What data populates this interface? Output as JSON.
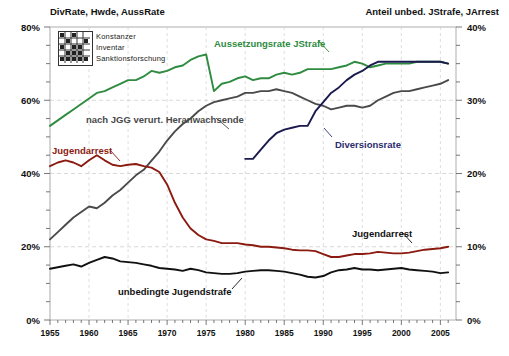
{
  "header": {
    "left": "DivRate, Hwde, AussRate",
    "right": "Anteil unbed. JStrafe, JArrest"
  },
  "logo": {
    "line1": "Konstanzer",
    "line2": "Inventar",
    "line3": "Sanktionsforschung",
    "icon": "kis-logo-icon"
  },
  "axes": {
    "left_ticks": [
      "80%",
      "60%",
      "40%",
      "20%",
      "0%"
    ],
    "right_ticks": [
      "40%",
      "30%",
      "20%",
      "10%",
      "0%"
    ],
    "x_ticks": [
      "1955",
      "1960",
      "1965",
      "1970",
      "1975",
      "1980",
      "1985",
      "1990",
      "1995",
      "2000",
      "2005"
    ]
  },
  "labels": {
    "aussetzungsrate": "Aussetzungsrate JStrafe",
    "heranwachsende": "nach JGG verurt. Heranwachsende",
    "jugendarrest_left": "Jugendarrest",
    "jugendarrest_right": "Jugendarrest",
    "diversionsrate": "Diversionsrate",
    "unbedingte": "unbedingte Jugendstrafe"
  },
  "colors": {
    "green": "#2e8b3f",
    "gray": "#4a4a4a",
    "darkred": "#8b1a10",
    "navy": "#1a1a4e",
    "black": "#111111",
    "grid": "#cfcfcf",
    "axis": "#9a9a9a"
  },
  "chart_data": {
    "type": "line",
    "title": "",
    "xlabel": "",
    "ylabel": "DivRate, Hwde, AussRate",
    "y2label": "Anteil unbed. JStrafe, JArrest",
    "xlim": [
      1955,
      2007
    ],
    "ylim": [
      0,
      80
    ],
    "y2lim": [
      0,
      40
    ],
    "grid": true,
    "legend": "inline-annotations",
    "x": [
      1955,
      1956,
      1957,
      1958,
      1959,
      1960,
      1961,
      1962,
      1963,
      1964,
      1965,
      1966,
      1967,
      1968,
      1969,
      1970,
      1971,
      1972,
      1973,
      1974,
      1975,
      1976,
      1977,
      1978,
      1979,
      1980,
      1981,
      1982,
      1983,
      1984,
      1985,
      1986,
      1987,
      1988,
      1989,
      1990,
      1991,
      1992,
      1993,
      1994,
      1995,
      1996,
      1997,
      1998,
      1999,
      2000,
      2001,
      2002,
      2003,
      2004,
      2005,
      2006
    ],
    "series": [
      {
        "name": "Aussetzungsrate JStrafe",
        "axis": "left",
        "color": "#2e8b3f",
        "values": [
          53.0,
          54.5,
          56.0,
          57.5,
          59.0,
          60.5,
          62.0,
          62.5,
          63.5,
          64.5,
          65.5,
          65.5,
          66.5,
          68.0,
          67.5,
          68.0,
          69.0,
          69.5,
          71.0,
          72.0,
          72.5,
          62.5,
          64.5,
          65.0,
          66.0,
          66.5,
          65.5,
          66.0,
          66.0,
          67.0,
          67.5,
          67.0,
          67.5,
          68.5,
          68.5,
          68.5,
          68.5,
          69.0,
          69.5,
          70.5,
          70.0,
          69.0,
          69.5,
          70.0,
          70.0,
          70.0,
          70.0,
          70.5,
          70.5,
          70.5,
          70.5,
          70.0
        ]
      },
      {
        "name": "nach JGG verurt. Heranwachsende",
        "axis": "left",
        "color": "#4a4a4a",
        "values": [
          22.0,
          24.0,
          26.0,
          28.0,
          29.5,
          31.0,
          30.5,
          32.0,
          34.0,
          35.5,
          37.5,
          39.5,
          41.0,
          43.5,
          46.0,
          49.0,
          51.5,
          53.5,
          55.0,
          57.0,
          58.5,
          59.5,
          60.0,
          60.5,
          61.0,
          62.0,
          62.0,
          62.5,
          62.5,
          63.0,
          62.5,
          62.0,
          61.0,
          60.0,
          59.0,
          58.5,
          57.5,
          58.0,
          58.5,
          58.5,
          58.0,
          58.5,
          60.0,
          61.0,
          62.0,
          62.5,
          62.5,
          63.0,
          63.5,
          64.0,
          64.5,
          65.5
        ]
      },
      {
        "name": "Diversionsrate",
        "axis": "left",
        "color": "#1a1a4e",
        "values": [
          null,
          null,
          null,
          null,
          null,
          null,
          null,
          null,
          null,
          null,
          null,
          null,
          null,
          null,
          null,
          null,
          null,
          null,
          null,
          null,
          null,
          null,
          null,
          null,
          null,
          44.0,
          44.0,
          46.5,
          49.0,
          51.0,
          52.0,
          52.5,
          53.0,
          53.0,
          57.0,
          59.5,
          62.0,
          63.5,
          65.5,
          67.0,
          68.0,
          69.5,
          70.5,
          70.5,
          70.5,
          70.5,
          70.5,
          70.5,
          70.5,
          70.5,
          70.5,
          70.0
        ]
      },
      {
        "name": "Jugendarrest",
        "axis": "right",
        "color": "#8b1a10",
        "values": [
          21.0,
          21.5,
          21.8,
          21.5,
          21.0,
          21.8,
          22.5,
          21.8,
          21.2,
          21.0,
          21.2,
          21.3,
          21.0,
          20.8,
          20.2,
          18.5,
          16.0,
          14.0,
          12.5,
          11.6,
          11.0,
          10.8,
          10.5,
          10.5,
          10.5,
          10.3,
          10.2,
          10.0,
          10.0,
          9.9,
          9.8,
          9.6,
          9.5,
          9.5,
          9.4,
          9.0,
          8.6,
          8.6,
          8.8,
          9.0,
          9.0,
          9.1,
          9.3,
          9.2,
          9.1,
          9.1,
          9.2,
          9.4,
          9.6,
          9.7,
          9.8,
          10.0
        ]
      },
      {
        "name": "unbedingte Jugendstrafe",
        "axis": "right",
        "color": "#111111",
        "values": [
          7.0,
          7.2,
          7.4,
          7.6,
          7.3,
          7.8,
          8.2,
          8.6,
          8.4,
          8.0,
          7.9,
          7.8,
          7.6,
          7.4,
          7.1,
          7.0,
          6.9,
          6.7,
          7.0,
          6.8,
          6.5,
          6.4,
          6.3,
          6.3,
          6.4,
          6.6,
          6.7,
          6.8,
          6.8,
          6.7,
          6.6,
          6.4,
          6.2,
          5.9,
          5.8,
          6.0,
          6.5,
          6.8,
          6.9,
          7.1,
          6.9,
          6.9,
          6.8,
          6.9,
          7.0,
          7.1,
          6.9,
          6.8,
          6.7,
          6.6,
          6.4,
          6.5
        ]
      }
    ]
  },
  "annotations": [
    {
      "text": "Aussetzungsrate JStrafe",
      "color": "#2e8b3f"
    },
    {
      "text": "nach JGG verurt. Heranwachsende",
      "color": "#4a4a4a"
    },
    {
      "text": "Jugendarrest",
      "color": "#8b1a10"
    },
    {
      "text": "Diversionsrate",
      "color": "#1a1a4e"
    },
    {
      "text": "unbedingte Jugendstrafe",
      "color": "#111111"
    }
  ]
}
